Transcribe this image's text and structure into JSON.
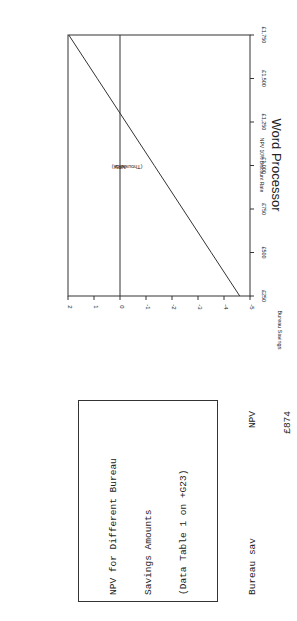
{
  "chart_data": {
    "type": "line",
    "title": "Word Processor",
    "subtitle": "NPV 10% Discount Rate",
    "xlabel": "Bureau Savings",
    "ylabel": "NPV",
    "ylabel_unit": "(Thousands)",
    "x_tick_labels": [
      "£250",
      "£500",
      "£750",
      "£1,000",
      "£1,250",
      "£1,500",
      "£1,750"
    ],
    "x": [
      250,
      500,
      750,
      1000,
      1250,
      1500,
      1750
    ],
    "y_tick_labels": [
      "2",
      "1",
      "0",
      "-1",
      "-2",
      "-3",
      "-4",
      "-5"
    ],
    "ylim": [
      -5,
      2
    ],
    "xlim": [
      250,
      1750
    ],
    "series": [
      {
        "name": "NPV",
        "values": [
          -4.605,
          -3.509,
          -2.414,
          -1.318,
          -0.222,
          0.874,
          1.97
        ]
      }
    ],
    "zero_line": true,
    "grid": false,
    "orientation": "rotated 90 degrees"
  },
  "table": {
    "title_lines": [
      "NPV for Different Bureau",
      "Savings Amounts",
      "(Data Table 1 on +G23)"
    ],
    "header": [
      "Bureau sav",
      "NPV"
    ],
    "base_value": "£874",
    "rows": [
      [
        "£250",
        "(£4,605)"
      ],
      [
        "£500",
        "(£3,509)"
      ],
      [
        "£750",
        "(£2,414)"
      ],
      [
        "£1,000",
        "(£1,318)"
      ],
      [
        "£1,250",
        "(£222)"
      ],
      [
        "£1,500",
        "£874"
      ],
      [
        "£1,750",
        "£1,970"
      ]
    ]
  }
}
